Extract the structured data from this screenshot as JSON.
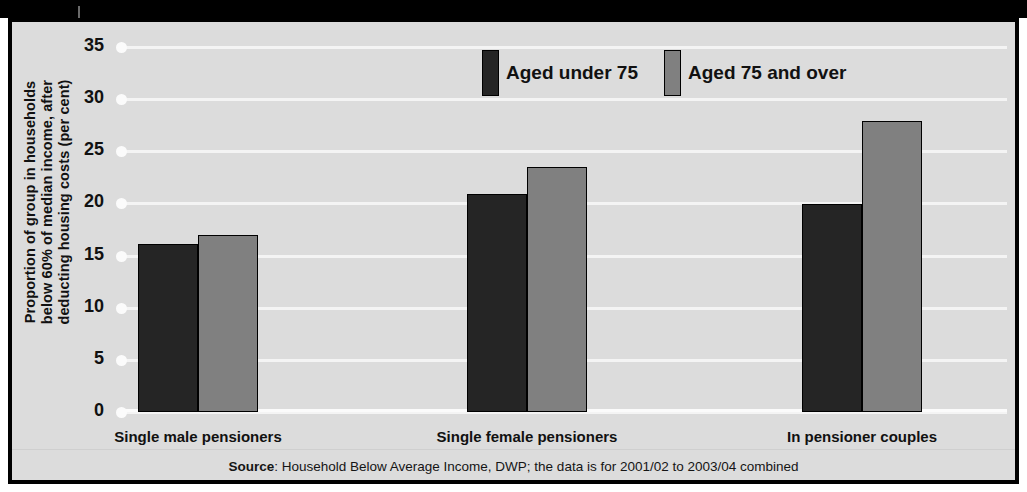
{
  "figure": {
    "source_prefix": "Source",
    "source_text": ": Household Below Average Income, DWP; the data is for 2001/02 to 2003/04 combined"
  },
  "colors": {
    "series_dark": "#252525",
    "series_grey": "#808080",
    "plot_background": "#dcdcdc",
    "gridline": "#f4f4f4",
    "frame": "#000000"
  },
  "chart_data": {
    "type": "bar",
    "title": "",
    "subtitle": "",
    "xlabel": "",
    "ylabel": "Proportion of group in households below 60% of median income, after deducting housing costs (per cent)",
    "ylabel_lines": [
      "Proportion of group in households",
      "below 60% of median income, after",
      "deducting housing costs (per cent)"
    ],
    "categories": [
      "Single male pensioners",
      "Single female pensioners",
      "In pensioner couples"
    ],
    "series": [
      {
        "name": "Aged under 75",
        "color": "#252525",
        "values": [
          16.1,
          20.9,
          19.9
        ]
      },
      {
        "name": "Aged 75 and over",
        "color": "#808080",
        "values": [
          17.0,
          23.5,
          27.9
        ]
      }
    ],
    "ylim": [
      0,
      35
    ],
    "ytick_step": 5,
    "yticks": [
      0,
      5,
      10,
      15,
      20,
      25,
      30,
      35
    ],
    "ytick_labels": [
      "0",
      "5",
      "10",
      "15",
      "20",
      "25",
      "30",
      "35"
    ],
    "grid": true,
    "grid_axis": "y",
    "legend_position": "top-center",
    "legend": [
      "Aged under 75",
      "Aged 75 and over"
    ]
  }
}
